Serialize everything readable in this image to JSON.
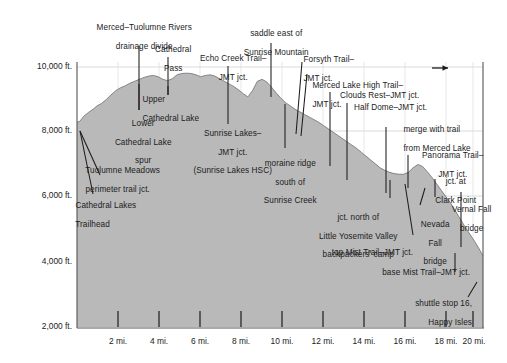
{
  "chart_data": {
    "type": "area",
    "title": "",
    "xlabel": "",
    "ylabel": "",
    "xlim": [
      0,
      21.5
    ],
    "ylim": [
      2000,
      10400
    ],
    "grid": true,
    "legend_position": "none",
    "units_x": "miles",
    "units_y": "feet",
    "direction_arrow": "→",
    "x_ticks": [
      "2 mi.",
      "4 mi.",
      "6 mi.",
      "8 mi.",
      "10 mi.",
      "12 mi.",
      "14 mi.",
      "16 mi.",
      "18 mi.",
      "20 mi."
    ],
    "x_tick_values": [
      2,
      4,
      6,
      8,
      10,
      12,
      14,
      16,
      18,
      20
    ],
    "y_ticks": [
      "10,000 ft.",
      "8,000 ft.",
      "6,000 ft.",
      "4,000 ft.",
      "2,000 ft."
    ],
    "y_tick_values": [
      10000,
      8000,
      6000,
      4000,
      2000
    ],
    "gridlines_y": [
      10000,
      8000,
      6000
    ],
    "series": [
      {
        "name": "John Muir Trail elevation profile",
        "x": [
          0.0,
          0.15,
          0.35,
          0.6,
          0.85,
          1.05,
          1.3,
          1.55,
          1.8,
          2.05,
          2.3,
          2.55,
          2.8,
          3.05,
          3.3,
          3.55,
          3.8,
          4.05,
          4.3,
          4.55,
          4.8,
          5.05,
          5.3,
          5.55,
          5.8,
          6.05,
          6.3,
          6.55,
          6.8,
          7.05,
          7.3,
          7.55,
          7.8,
          8.05,
          8.3,
          8.55,
          8.8,
          9.05,
          9.3,
          9.55,
          9.8,
          10.05,
          10.3,
          10.55,
          10.8,
          11.05,
          11.3,
          11.55,
          11.8,
          12.05,
          12.3,
          12.55,
          12.8,
          13.05,
          13.3,
          13.55,
          13.8,
          14.05,
          14.3,
          14.55,
          14.8,
          15.05,
          15.3,
          15.55,
          15.8,
          16.05,
          16.3,
          16.55,
          16.8,
          17.05,
          17.3,
          17.55,
          17.8,
          18.05,
          18.3,
          18.55,
          18.8,
          19.05,
          19.3,
          19.55,
          19.8,
          20.05,
          20.3,
          20.55,
          20.8,
          21.05,
          21.3,
          21.5
        ],
        "y": [
          8300,
          8330,
          8480,
          8600,
          8700,
          8800,
          8880,
          9000,
          9140,
          9270,
          9360,
          9420,
          9500,
          9560,
          9620,
          9680,
          9720,
          9740,
          9700,
          9620,
          9580,
          9640,
          9760,
          9800,
          9810,
          9800,
          9760,
          9700,
          9740,
          9760,
          9720,
          9640,
          9560,
          9480,
          9400,
          9300,
          9180,
          9080,
          9280,
          9560,
          9620,
          9540,
          9380,
          9200,
          9040,
          8900,
          8800,
          8700,
          8620,
          8540,
          8460,
          8380,
          8300,
          8200,
          8100,
          8000,
          7900,
          7800,
          7700,
          7600,
          7500,
          7380,
          7260,
          7140,
          7020,
          6900,
          6820,
          6760,
          6720,
          6700,
          6700,
          6760,
          6900,
          7000,
          6940,
          6780,
          6600,
          6400,
          6200,
          6000,
          5800,
          5560,
          5320,
          5080,
          4860,
          4640,
          4400,
          4180
        ],
        "fill_color": "#b9b9b9",
        "line_color": "#6e6e6e"
      }
    ],
    "annotations": [
      {
        "id": "merced-tuolumne-divide",
        "label": "Merced–Tuolumne Rivers\ndrainage divide",
        "x_mile": 3.6,
        "elevation": 9640
      },
      {
        "id": "cathedral-pass",
        "label": "Cathedral\nPass",
        "x_mile": 5.0,
        "elevation": 9720
      },
      {
        "id": "echo-creek-trail-jmt-jct",
        "label": "Echo Creek Trail–\nJMT jct.",
        "x_mile": 7.8,
        "elevation": 9560
      },
      {
        "id": "saddle-east-sunrise-mountain",
        "label": "saddle east of\nSunrise Mountain",
        "x_mile": 9.8,
        "elevation": 9620
      },
      {
        "id": "forsyth-trail-jmt-jct",
        "label": "Forsyth Trail–\nJMT jct.",
        "x_mile": 13.5,
        "elevation": 8020
      },
      {
        "id": "merced-lake-high-trail-jmt-jct",
        "label": "Merced Lake High Trail–\nJMT jct.",
        "x_mile": 13.8,
        "elevation": 7900
      },
      {
        "id": "clouds-rest-jmt-jct",
        "label": "Clouds Rest–JMT jct.",
        "x_mile": 14.9,
        "elevation": 7340
      },
      {
        "id": "half-dome-jmt-jct",
        "label": "Half Dome–JMT jct.",
        "x_mile": 15.6,
        "elevation": 6960
      },
      {
        "id": "merge-with-trail-merced-lake",
        "label": "merge with trail\nfrom Merced Lake",
        "x_mile": 17.4,
        "elevation": 6700
      },
      {
        "id": "panorama-trail-jmt-jct",
        "label": "Panorama Trail–\nJMT jct.",
        "x_mile": 18.3,
        "elevation": 6960
      },
      {
        "id": "jct-at-clark-point",
        "label": "jct. at\nClark Point",
        "x_mile": 19.6,
        "elevation": 6020
      },
      {
        "id": "vernal-fall-bridge",
        "label": "Vernal Fall\nbridge",
        "x_mile": 20.3,
        "elevation": 5060
      },
      {
        "id": "upper-cathedral-lake",
        "label": "Upper\nCathedral Lake",
        "x_mile": 4.6,
        "elevation": 9680
      },
      {
        "id": "lower-cathedral-lake-spur",
        "label": "Lower\nCathedral Lake\nspur",
        "x_mile": 3.1,
        "elevation": 9540
      },
      {
        "id": "sunrise-lakes-jmt-jct",
        "label": "Sunrise Lakes–\nJMT jct.\n(Sunrise Lakes HSC)",
        "x_mile": 8.3,
        "elevation": 9420
      },
      {
        "id": "tuolumne-meadows-perimeter-trail-jct",
        "label": "Tuolumne Meadows\nperimeter trail jct.",
        "x_mile": 0.4,
        "elevation": 8180
      },
      {
        "id": "cathedral-lakes-trailhead",
        "label": "Cathedral Lakes\nTrailhead",
        "x_mile": 0.0,
        "elevation": 8300
      },
      {
        "id": "moraine-ridge-south-sunrise-creek",
        "label": "moraine ridge\nsouth of\nSunrise Creek",
        "x_mile": 11.2,
        "elevation": 8800
      },
      {
        "id": "jct-north-little-yosemite-valley",
        "label": "jct. north of\nLittle Yosemite Valley\nbackpackers' camp",
        "x_mile": 16.6,
        "elevation": 6720
      },
      {
        "id": "top-mist-trail-jmt-jct",
        "label": "top Mist Trail–JMT jct.",
        "x_mile": 17.9,
        "elevation": 6960
      },
      {
        "id": "nevada-fall-bridge",
        "label": "Nevada\nFall\nbridge",
        "x_mile": 18.1,
        "elevation": 6900
      },
      {
        "id": "base-mist-trail-jmt-jct",
        "label": "base Mist Trail–JMT jct.",
        "x_mile": 20.3,
        "elevation": 5060
      },
      {
        "id": "shuttle-stop-16-happy-isles",
        "label": "shuttle stop 16,\nHappy Isles",
        "x_mile": 21.2,
        "elevation": 4200
      }
    ]
  },
  "labels": {
    "merced_tuolumne_divide_l1": "Merced–Tuolumne Rivers",
    "merced_tuolumne_divide_l2": "drainage divide",
    "cathedral_pass_l1": "Cathedral",
    "cathedral_pass_l2": "Pass",
    "echo_creek_l1": "Echo Creek Trail–",
    "echo_creek_l2": "JMT jct.",
    "saddle_l1": "saddle east of",
    "saddle_l2": "Sunrise Mountain",
    "forsyth_l1": "Forsyth Trail–",
    "forsyth_l2": "JMT jct.",
    "merced_lake_high_l1": "Merced Lake High Trail–",
    "merced_lake_high_l2": "JMT jct.",
    "clouds_rest": "Clouds Rest–JMT jct.",
    "half_dome": "Half Dome–JMT jct.",
    "merge_l1": "merge with trail",
    "merge_l2": "from Merced Lake",
    "panorama_l1": "Panorama Trail–",
    "panorama_l2": "JMT jct.",
    "clark_point_l1": "jct. at",
    "clark_point_l2": "Clark Point",
    "vernal_l1": "Vernal Fall",
    "vernal_l2": "bridge",
    "upper_cathedral_l1": "Upper",
    "upper_cathedral_l2": "Cathedral Lake",
    "lower_cathedral_l1": "Lower",
    "lower_cathedral_l2": "Cathedral Lake",
    "lower_cathedral_l3": "spur",
    "sunrise_lakes_l1": "Sunrise Lakes–",
    "sunrise_lakes_l2": "JMT jct.",
    "sunrise_lakes_l3": "(Sunrise Lakes HSC)",
    "tuolumne_meadows_l1": "Tuolumne Meadows",
    "tuolumne_meadows_l2": "perimeter trail jct.",
    "cathedral_trailhead_l1": "Cathedral Lakes",
    "cathedral_trailhead_l2": "Trailhead",
    "moraine_l1": "moraine ridge",
    "moraine_l2": "south of",
    "moraine_l3": "Sunrise Creek",
    "lyv_l1": "jct. north of",
    "lyv_l2": "Little Yosemite Valley",
    "lyv_l3": "backpackers' camp",
    "top_mist": "top Mist Trail–JMT jct.",
    "nevada_l1": "Nevada",
    "nevada_l2": "Fall",
    "nevada_l3": "bridge",
    "base_mist": "base Mist Trail–JMT jct.",
    "shuttle_l1": "shuttle stop 16,",
    "shuttle_l2": "Happy Isles"
  },
  "axis": {
    "y0": "10,000 ft.",
    "y1": "8,000 ft.",
    "y2": "6,000 ft.",
    "y3": "4,000 ft.",
    "y4": "2,000 ft.",
    "x0": "2 mi.",
    "x1": "4 mi.",
    "x2": "6 mi.",
    "x3": "8 mi.",
    "x4": "10 mi.",
    "x5": "12 mi.",
    "x6": "14 mi.",
    "x7": "16 mi.",
    "x8": "18 mi.",
    "x9": "20 mi."
  },
  "colors": {
    "terrain_fill": "#b9b9b9",
    "terrain_edge": "#6e6e6e",
    "axis": "#555555",
    "gridline": "#c9c9c9",
    "leader": "#1b1b1b",
    "text": "#1b1b1b",
    "background": "#ffffff"
  }
}
